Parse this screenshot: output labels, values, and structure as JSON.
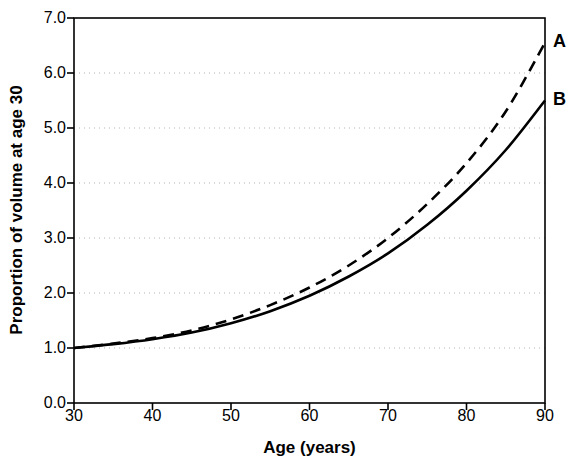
{
  "chart_data": {
    "type": "line",
    "title": "",
    "xlabel": "Age (years)",
    "ylabel": "Proportion of volume at age 30",
    "xlim": [
      30,
      90
    ],
    "ylim": [
      0.0,
      7.0
    ],
    "xticks": [
      30,
      40,
      50,
      60,
      70,
      80,
      90
    ],
    "xtick_labels": [
      "30",
      "40",
      "50",
      "60",
      "70",
      "80",
      "90"
    ],
    "yticks": [
      0.0,
      1.0,
      2.0,
      3.0,
      4.0,
      5.0,
      6.0,
      7.0
    ],
    "ytick_labels": [
      "0.0",
      "1.0",
      "2.0",
      "3.0",
      "4.0",
      "5.0",
      "6.0",
      "7.0"
    ],
    "grid": "horizontal-dotted",
    "gridlines_at": [
      1.0,
      2.0,
      3.0,
      4.0,
      5.0,
      6.0
    ],
    "legend_position": "inline-right-end-labels",
    "x": [
      30,
      35,
      40,
      45,
      50,
      55,
      60,
      65,
      70,
      75,
      80,
      85,
      90
    ],
    "series": [
      {
        "name": "A",
        "label": "A",
        "style": "dashed",
        "color": "#000000",
        "values": [
          1.0,
          1.08,
          1.18,
          1.32,
          1.52,
          1.78,
          2.1,
          2.5,
          3.0,
          3.62,
          4.36,
          5.3,
          6.55
        ]
      },
      {
        "name": "B",
        "label": "B",
        "style": "solid",
        "color": "#000000",
        "values": [
          1.0,
          1.07,
          1.16,
          1.28,
          1.45,
          1.67,
          1.95,
          2.3,
          2.72,
          3.24,
          3.86,
          4.6,
          5.5
        ]
      }
    ],
    "annotations": [
      {
        "text": "A",
        "x": 90,
        "y": 6.55,
        "position": "right-of-axis"
      },
      {
        "text": "B",
        "x": 90,
        "y": 5.5,
        "position": "right-of-axis"
      }
    ],
    "colors": {
      "axis": "#000000",
      "grid": "#b3b3b3",
      "background": "#ffffff",
      "series_a": "#000000",
      "series_b": "#000000"
    }
  }
}
